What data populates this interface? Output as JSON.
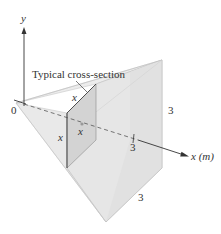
{
  "figure": {
    "axis_y_label": "y",
    "axis_x_label": "x (m)",
    "origin_label": "0",
    "callout_label": "Typical cross-section",
    "cross_section_top_label": "x",
    "cross_section_side_label": "x",
    "cross_section_position_label": "x",
    "tick_label_x": "3",
    "right_edge_label": "3",
    "bottom_edge_label": "3"
  },
  "colors": {
    "face_light": "#efefef",
    "face_mid": "#e4e4e4",
    "face_dark": "#dadada",
    "cross_section": "#cfcfcf",
    "line": "#333333",
    "edge": "#9a9a9a"
  }
}
